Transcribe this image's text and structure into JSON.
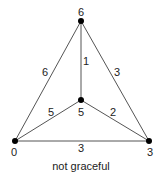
{
  "graph": {
    "caption": "not graceful",
    "vertices": [
      {
        "id": "top",
        "label": "6",
        "x": 81,
        "y": 21
      },
      {
        "id": "center",
        "label": "5",
        "x": 81,
        "y": 100
      },
      {
        "id": "bottom-left",
        "label": "0",
        "x": 15,
        "y": 141
      },
      {
        "id": "bottom-right",
        "label": "3",
        "x": 149,
        "y": 141
      }
    ],
    "edges": [
      {
        "from": "top",
        "to": "bottom-left",
        "label": "6"
      },
      {
        "from": "top",
        "to": "center",
        "label": "1"
      },
      {
        "from": "top",
        "to": "bottom-right",
        "label": "3"
      },
      {
        "from": "center",
        "to": "bottom-left",
        "label": "5"
      },
      {
        "from": "center",
        "to": "bottom-right",
        "label": "2"
      },
      {
        "from": "bottom-left",
        "to": "bottom-right",
        "label": "3"
      }
    ]
  }
}
